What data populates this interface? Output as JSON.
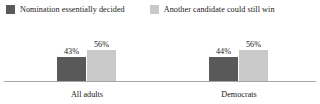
{
  "chart_data": {
    "type": "bar",
    "title": "",
    "subtitle": "",
    "xlabel": "",
    "ylabel": "",
    "grid": false,
    "legend_position": "top",
    "ylim": [
      0,
      60
    ],
    "categories": [
      "All adults",
      "Democrats"
    ],
    "series": [
      {
        "name": "Nomination essentially decided",
        "color": "#595959",
        "values": [
          43,
          44
        ],
        "labels": [
          "43%",
          "56%"
        ]
      },
      {
        "name": "Another candidate could still win",
        "color": "#c9c9c9",
        "values": [
          56,
          56
        ],
        "labels": [
          "56%",
          "56%"
        ]
      }
    ],
    "groups": [
      {
        "category": "All adults",
        "bars": [
          {
            "series": "Nomination essentially decided",
            "value": 43,
            "label": "43%",
            "color": "#595959"
          },
          {
            "series": "Another candidate could still win",
            "value": 56,
            "label": "56%",
            "color": "#c9c9c9"
          }
        ]
      },
      {
        "category": "Democrats",
        "bars": [
          {
            "series": "Nomination essentially decided",
            "value": 44,
            "label": "44%",
            "color": "#595959"
          },
          {
            "series": "Another candidate could still win",
            "value": 56,
            "label": "56%",
            "color": "#c9c9c9"
          }
        ]
      }
    ]
  },
  "legend": {
    "entries": [
      {
        "label": "Nomination essentially decided",
        "color": "#595959"
      },
      {
        "label": "Another candidate could still win",
        "color": "#c9c9c9"
      }
    ]
  },
  "axis": {
    "baseline_color": "#a6a6a6"
  }
}
